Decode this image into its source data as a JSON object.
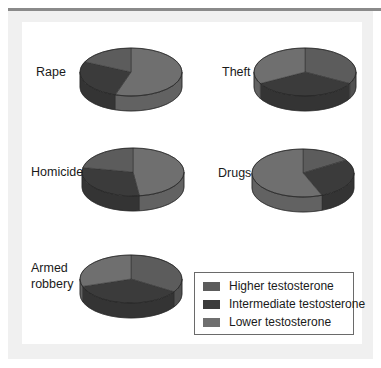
{
  "chart_data": {
    "type": "pie",
    "title": "",
    "style": "3d",
    "legend_position": "bottom-right",
    "legend": [
      {
        "key": "higher",
        "label": "Higher testosterone",
        "color": "#5c5c5c"
      },
      {
        "key": "intermediate",
        "label": "Intermediate testosterone",
        "color": "#3b3b3b"
      },
      {
        "key": "lower",
        "label": "Lower testosterone",
        "color": "#6f6f6f"
      }
    ],
    "pies": [
      {
        "name": "rape",
        "label": [
          "Rape"
        ],
        "values": {
          "lower": 55,
          "intermediate": 27,
          "higher": 18
        }
      },
      {
        "name": "theft",
        "label": [
          "Theft"
        ],
        "values": {
          "higher": 33,
          "intermediate": 34,
          "lower": 33
        }
      },
      {
        "name": "homicide",
        "label": [
          "Homicide"
        ],
        "values": {
          "lower": 48,
          "intermediate": 30,
          "higher": 22
        }
      },
      {
        "name": "drugs",
        "label": [
          "Drugs"
        ],
        "values": {
          "higher": 16,
          "intermediate": 28,
          "lower": 56
        }
      },
      {
        "name": "armed-robbery",
        "label": [
          "Armed",
          "robbery"
        ],
        "values": {
          "higher": 34,
          "intermediate": 36,
          "lower": 30
        }
      }
    ]
  }
}
